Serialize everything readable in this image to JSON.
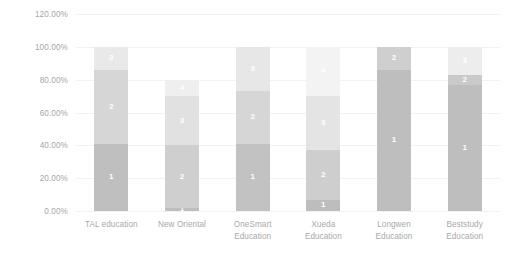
{
  "chart_data": {
    "type": "bar",
    "subtype": "stacked-bar",
    "title": "",
    "xlabel": "",
    "ylabel": "",
    "ylim": [
      0,
      120
    ],
    "grid": true,
    "legend": "none",
    "stacked": true,
    "y_tick_labels": [
      "120.00%",
      "100.00%",
      "80.00%",
      "60.00%",
      "40.00%",
      "20.00%",
      "0.00%"
    ],
    "y_tick_values": [
      120,
      100,
      80,
      60,
      40,
      20,
      0
    ],
    "categories": [
      "TAL education",
      "New Oriental",
      "OneSmart Education",
      "Xueda Education",
      "Longwen Education",
      "Beststudy Education"
    ],
    "category_label_lines": [
      [
        "TAL education"
      ],
      [
        "New Oriental"
      ],
      [
        "OneSmart",
        "Education"
      ],
      [
        "Xueda",
        "Education"
      ],
      [
        "Longwen",
        "Education"
      ],
      [
        "Beststudy",
        "Education"
      ]
    ],
    "series": [
      {
        "name": "1",
        "values": [
          41,
          2,
          41,
          7,
          86,
          77
        ]
      },
      {
        "name": "2",
        "values": [
          45,
          38,
          32,
          30,
          14,
          6
        ]
      },
      {
        "name": "3",
        "values": [
          14,
          30,
          27,
          33,
          0,
          17
        ]
      },
      {
        "name": "4",
        "values": [
          0,
          10,
          0,
          30,
          0,
          0
        ]
      }
    ],
    "series_colors": [
      "#bfbfbf",
      "#d9d9d9",
      "#e8e8e8",
      "#f4f4f4"
    ],
    "totals": [
      100,
      80,
      100,
      100,
      100,
      100
    ],
    "bars": [
      {
        "category": "TAL education",
        "total": 100,
        "segments": [
          {
            "label": "1",
            "value": 41,
            "color": "#bfbfbf",
            "show_label": true
          },
          {
            "label": "2",
            "value": 45,
            "color": "#d6d6d6",
            "show_label": true
          },
          {
            "label": "3",
            "value": 14,
            "color": "#e9e9e9",
            "show_label": true
          }
        ]
      },
      {
        "category": "New Oriental",
        "total": 80,
        "segments": [
          {
            "label": "1",
            "value": 2,
            "color": "#bfbfbf",
            "show_label": true
          },
          {
            "label": "2",
            "value": 38,
            "color": "#cfcfcf",
            "show_label": true
          },
          {
            "label": "3",
            "value": 30,
            "color": "#e1e1e1",
            "show_label": true
          },
          {
            "label": "4",
            "value": 10,
            "color": "#efefef",
            "show_label": true
          }
        ]
      },
      {
        "category": "OneSmart Education",
        "total": 100,
        "segments": [
          {
            "label": "1",
            "value": 41,
            "color": "#c2c2c2",
            "show_label": true
          },
          {
            "label": "2",
            "value": 32,
            "color": "#d6d6d6",
            "show_label": true
          },
          {
            "label": "3",
            "value": 27,
            "color": "#e7e7e7",
            "show_label": true
          }
        ]
      },
      {
        "category": "Xueda Education",
        "total": 100,
        "segments": [
          {
            "label": "1",
            "value": 7,
            "color": "#bdbdbd",
            "show_label": true
          },
          {
            "label": "2",
            "value": 30,
            "color": "#cecece",
            "show_label": true
          },
          {
            "label": "3",
            "value": 33,
            "color": "#e4e4e4",
            "show_label": true
          },
          {
            "label": "4",
            "value": 30,
            "color": "#f3f3f3",
            "show_label": true
          }
        ]
      },
      {
        "category": "Longwen Education",
        "total": 100,
        "segments": [
          {
            "label": "1",
            "value": 86,
            "color": "#bebebe",
            "show_label": true
          },
          {
            "label": "2",
            "value": 14,
            "color": "#cfcfcf",
            "show_label": true
          }
        ]
      },
      {
        "category": "Beststudy Education",
        "total": 100,
        "segments": [
          {
            "label": "1",
            "value": 77,
            "color": "#bebebe",
            "show_label": true
          },
          {
            "label": "2",
            "value": 6,
            "color": "#cacaca",
            "show_label": true
          },
          {
            "label": "3",
            "value": 17,
            "color": "#ededed",
            "show_label": true
          }
        ]
      }
    ]
  },
  "axis": {
    "gridline_color": "#f2f2f2",
    "tick_text_color": "#a6a6a6"
  },
  "plot": {
    "background": "#ffffff"
  }
}
